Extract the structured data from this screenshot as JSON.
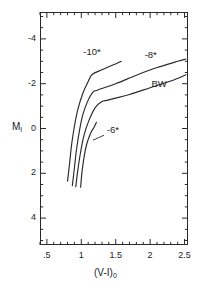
{
  "figure": {
    "name": "color-magnitude-diagram"
  },
  "chart_data": {
    "type": "line",
    "title": "",
    "xlabel": "(V-I)0",
    "ylabel": "MI",
    "xlim": [
      0.4,
      2.55
    ],
    "ylim": [
      -5.2,
      5.2
    ],
    "y_inverted": true,
    "grid": false,
    "legend": "inline-annotations",
    "x_ticks_major": [
      0.5,
      1.0,
      1.5,
      2.0,
      2.5
    ],
    "x_ticklabels": [
      ".5",
      "1",
      "1.5",
      "2",
      "2.5"
    ],
    "x_tick_minor_step": 0.1,
    "y_ticks_major": [
      -4,
      -2,
      0,
      2,
      4
    ],
    "y_ticklabels": [
      "-4",
      "-2",
      "0",
      "2",
      "4"
    ],
    "y_tick_minor_step": 0.5,
    "series": [
      {
        "name": "-10*",
        "label": "-10*",
        "points": [
          [
            0.8,
            2.35
          ],
          [
            0.83,
            1.55
          ],
          [
            0.86,
            0.7
          ],
          [
            0.9,
            -0.1
          ],
          [
            0.95,
            -0.85
          ],
          [
            1.02,
            -1.55
          ],
          [
            1.1,
            -2.1
          ],
          [
            1.16,
            -2.42
          ],
          [
            1.3,
            -2.62
          ],
          [
            1.45,
            -2.82
          ],
          [
            1.58,
            -3.0
          ]
        ]
      },
      {
        "name": "-8*",
        "label": "-8*",
        "points": [
          [
            0.87,
            2.55
          ],
          [
            0.9,
            1.75
          ],
          [
            0.93,
            0.95
          ],
          [
            0.97,
            0.15
          ],
          [
            1.02,
            -0.6
          ],
          [
            1.09,
            -1.2
          ],
          [
            1.17,
            -1.62
          ],
          [
            1.24,
            -1.72
          ],
          [
            1.5,
            -2.0
          ],
          [
            1.8,
            -2.38
          ],
          [
            2.1,
            -2.72
          ],
          [
            2.4,
            -3.0
          ],
          [
            2.52,
            -3.1
          ]
        ]
      },
      {
        "name": "BW",
        "label": "BW",
        "points": [
          [
            0.92,
            2.6
          ],
          [
            0.95,
            1.85
          ],
          [
            0.99,
            1.05
          ],
          [
            1.04,
            0.3
          ],
          [
            1.11,
            -0.35
          ],
          [
            1.2,
            -0.92
          ],
          [
            1.3,
            -1.2
          ],
          [
            1.4,
            -1.28
          ],
          [
            1.7,
            -1.52
          ],
          [
            2.0,
            -1.82
          ],
          [
            2.3,
            -2.12
          ],
          [
            2.52,
            -2.4
          ]
        ]
      },
      {
        "name": "-6*",
        "label": "-6*",
        "points": [
          [
            0.99,
            2.62
          ],
          [
            1.01,
            1.95
          ],
          [
            1.04,
            1.28
          ],
          [
            1.08,
            0.68
          ],
          [
            1.14,
            0.18
          ],
          [
            1.19,
            -0.08
          ],
          [
            1.22,
            -0.28
          ]
        ]
      }
    ],
    "annotations": [
      {
        "text": "-10*",
        "x": 1.03,
        "y": -3.38
      },
      {
        "text": "-8*",
        "x": 1.92,
        "y": -3.25
      },
      {
        "text": "BW",
        "x": 2.02,
        "y": -1.95
      },
      {
        "text": "-6*",
        "x": 1.37,
        "y": 0.12
      }
    ]
  },
  "axes": {
    "x_label_text": "(V-I)",
    "x_label_sub": "0",
    "y_label_text": "M",
    "y_label_sub": "I"
  },
  "colors": {
    "line": "#2a2a2a",
    "text": "#1c1c1c",
    "background": "#ffffff"
  }
}
